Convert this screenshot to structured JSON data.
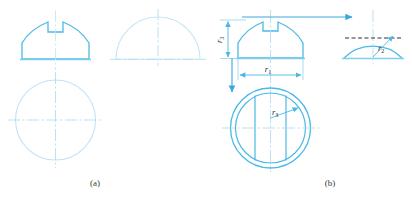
{
  "figure": {
    "title": "",
    "background_color": "#ffffff",
    "line_color_solid": "#4db8e8",
    "line_color_light": "#bfe4f5",
    "line_color_center": "#a9d9f0",
    "line_color_dashed_black": "#1a1a1a",
    "arrow_color": "#3aa8de",
    "text_color": "#3a3a3a"
  },
  "panels": [
    {
      "id": "panel-a",
      "caption": "(a)",
      "caption_x": 95,
      "caption_y": 186,
      "description": "Front view of slotted half-round part, light semicircle side view, and light circle top view with centerlines"
    },
    {
      "id": "panel-b",
      "caption": "(b)",
      "caption_x": 330,
      "caption_y": 186,
      "description": "Dimensioned version with r1, r2, r3 callouts and projection arrows"
    }
  ],
  "dimensions": [
    {
      "name": "r3-vertical",
      "label_base": "r",
      "label_sub": "3",
      "orientation": "vertical",
      "x": 222,
      "y": 42,
      "panel": "panel-b"
    },
    {
      "name": "r1-horizontal",
      "label_base": "r",
      "label_sub": "1",
      "orientation": "horizontal",
      "x": 268,
      "y": 71,
      "panel": "panel-b"
    },
    {
      "name": "r3-radius-circle",
      "label_base": "r",
      "label_sub": "3",
      "orientation": "radial",
      "x": 272,
      "y": 114,
      "panel": "panel-b"
    },
    {
      "name": "r2-radius-semicircle",
      "label_base": "r",
      "label_sub": "2",
      "orientation": "radial",
      "x": 381,
      "y": 49,
      "panel": "panel-b"
    }
  ],
  "annotations": {
    "projection_arrow_horizontal": "arrow pointing right from front view to side view",
    "projection_arrow_vertical": "arrow pointing down from front view to top view",
    "dashed_reference_line": "horizontal dashed line across side-view semicircle"
  }
}
